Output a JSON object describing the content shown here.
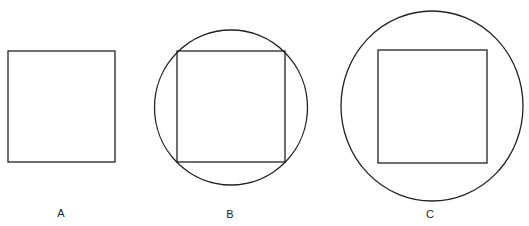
{
  "figures": [
    {
      "label": "A",
      "description": "square alone",
      "square": {
        "x": 8,
        "y": 51,
        "w": 107,
        "h": 111
      }
    },
    {
      "label": "B",
      "description": "square inscribed in circle (corners touch circle)",
      "square": {
        "x": 177,
        "y": 51,
        "w": 108,
        "h": 111
      },
      "circle": {
        "cx": 231,
        "cy": 107,
        "r": 77
      }
    },
    {
      "label": "C",
      "description": "square inside larger circle (not touching)",
      "square": {
        "x": 378,
        "y": 50,
        "w": 109,
        "h": 113
      },
      "circle": {
        "cx": 432,
        "cy": 106,
        "rx": 91,
        "ry": 95
      }
    }
  ],
  "labels": {
    "a": "A",
    "b": "B",
    "c": "C"
  },
  "stroke_color": "#222222"
}
